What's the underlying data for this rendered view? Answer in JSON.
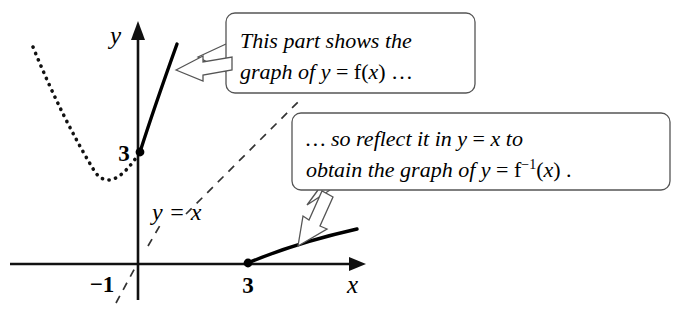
{
  "figure": {
    "background_color": "#ffffff",
    "ink_color": "#000000"
  },
  "axes": {
    "x_axis_label": "x",
    "y_axis_label": "y",
    "origin_px": [
      138,
      264
    ],
    "x_axis_from_px": [
      10,
      264
    ],
    "x_axis_to_px": [
      366,
      264
    ],
    "y_axis_from_px": [
      138,
      300
    ],
    "y_axis_to_px": [
      138,
      22
    ],
    "ticks": [
      {
        "label": "−1",
        "axis": "x",
        "value": -1,
        "pos_px": [
          102,
          283
        ]
      },
      {
        "label": "3",
        "axis": "x",
        "value": 3,
        "pos_px": [
          248,
          284
        ]
      },
      {
        "label": "3",
        "axis": "y",
        "value": 3,
        "pos_px": [
          124,
          160
        ]
      }
    ]
  },
  "marked_points": [
    {
      "name": "y-intercept-3",
      "coords": "(0, 3)",
      "pos_px": [
        140,
        152
      ]
    },
    {
      "name": "x-intercept-3",
      "coords": "(3, 0)",
      "pos_px": [
        248,
        263
      ]
    }
  ],
  "curves": [
    {
      "name": "parabola-dotted-branch",
      "style": "dotted",
      "description": "left branch of y = f(x) outside the restricted domain",
      "path": "M 33 47 Q 62 118 95 172 Q 112 195 140 152"
    },
    {
      "name": "function-solid-branch",
      "style": "solid",
      "description": "graph of y = f(x) on the restricted domain starting at (0, 3)",
      "path": "M 140 152 Q 154 108 177 44"
    },
    {
      "name": "inverse-solid-branch",
      "style": "solid",
      "description": "graph of y = f inverse of x starting at (3, 0)",
      "path": "M 248 263 Q 295 243 357 229"
    }
  ],
  "reference_line": {
    "name": "line-y-equals-x",
    "label": "y = x",
    "label_pos_px": [
      152,
      218
    ],
    "style": "dashed",
    "segment_lower": "M 116 303 L 136 266",
    "segment_middle": "M 148 246 L 162 222",
    "segment_upper": "M 186 214 L 302 98"
  },
  "callouts": [
    {
      "name": "callout-function",
      "box_px": {
        "x": 226,
        "y": 13,
        "width": 249,
        "height": 80,
        "radius": 9
      },
      "lines": [
        [
          {
            "text": "This part shows the",
            "style": "italic"
          }
        ],
        [
          {
            "text": "graph of ",
            "style": "italic"
          },
          {
            "text": "y",
            "style": "italic"
          },
          {
            "text": " = ",
            "style": "upright"
          },
          {
            "text": "f(",
            "style": "upright"
          },
          {
            "text": "x",
            "style": "italic"
          },
          {
            "text": ") …",
            "style": "upright"
          }
        ]
      ],
      "plain_text": "This part shows the graph of y = f(x) …",
      "tail": "M 226 44 L 198 57 L 226 72",
      "arrow": {
        "description": "hollow arrow pointing left to the solid f(x) curve",
        "shape": "M 176 70 L 203 56 L 203 62 L 232 57 L 232 70 L 203 75 L 203 81 Z"
      }
    },
    {
      "name": "callout-inverse",
      "box_px": {
        "x": 292,
        "y": 113,
        "width": 378,
        "height": 77,
        "radius": 9
      },
      "lines": [
        [
          {
            "text": "… so reflect it in  ",
            "style": "italic"
          },
          {
            "text": "y",
            "style": "italic"
          },
          {
            "text": " = ",
            "style": "upright"
          },
          {
            "text": "x",
            "style": "italic"
          },
          {
            "text": "  to",
            "style": "italic"
          }
        ],
        [
          {
            "text": "obtain the graph of ",
            "style": "italic"
          },
          {
            "text": "y",
            "style": "italic"
          },
          {
            "text": " = ",
            "style": "upright"
          },
          {
            "text": "f",
            "style": "upright"
          },
          {
            "text": "−1",
            "style": "superscript"
          },
          {
            "text": "(",
            "style": "upright"
          },
          {
            "text": "x",
            "style": "italic"
          },
          {
            "text": ") .",
            "style": "upright"
          }
        ]
      ],
      "plain_text": "… so reflect it in y = x to obtain the graph of y = f⁻¹(x).",
      "tail": "M 318 190 L 307 205 L 330 190",
      "arrow": {
        "description": "hollow arrow pointing down-left to the inverse curve",
        "shape": "M 298 246 L 303 216 L 309 220 L 322 191 L 333 197 L 320 226 L 327 229 Z"
      }
    }
  ]
}
